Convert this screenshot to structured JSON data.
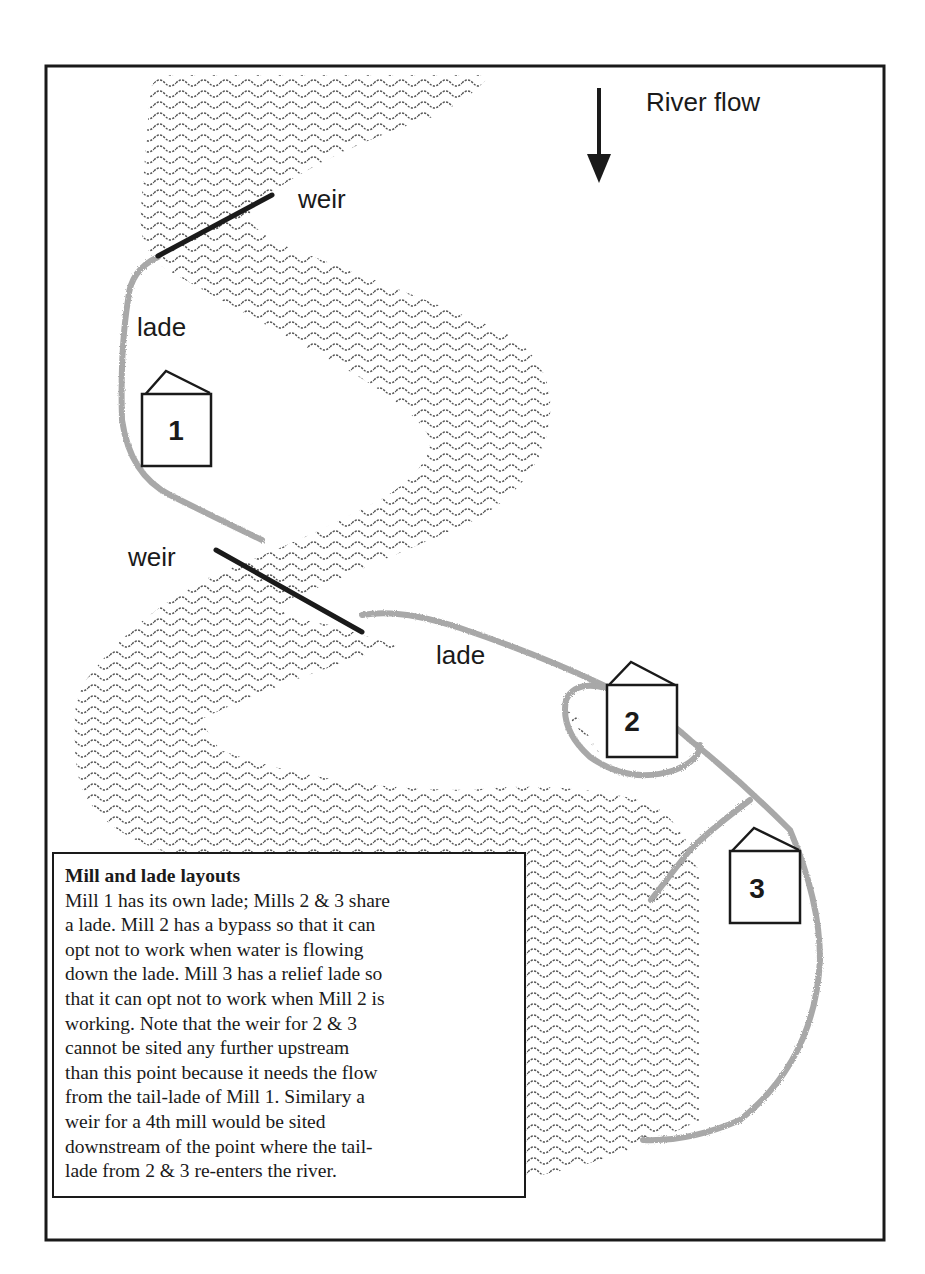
{
  "diagram": {
    "flow_label": "River flow",
    "flow_direction": "down",
    "weirs": [
      {
        "id": "weir-1",
        "label": "weir"
      },
      {
        "id": "weir-2",
        "label": "weir"
      }
    ],
    "lades": [
      {
        "id": "lade-1",
        "label": "lade"
      },
      {
        "id": "lade-2",
        "label": "lade"
      }
    ],
    "mills": [
      {
        "id": "mill-1",
        "number": "1"
      },
      {
        "id": "mill-2",
        "number": "2"
      },
      {
        "id": "mill-3",
        "number": "3"
      }
    ],
    "colors": {
      "ink": "#1a1a1a",
      "river_hatch": "#555555",
      "lade": "#a8a8a8",
      "paper": "#ffffff"
    }
  },
  "caption": {
    "title": "Mill and lade layouts",
    "lines": [
      "Mill 1 has its own lade; Mills 2 & 3 share",
      "a lade.  Mill 2 has a bypass so that it can",
      "opt not to work when water is flowing",
      "down the lade.  Mill 3 has a relief lade so",
      "that it can opt not to work when Mill 2 is",
      "working.  Note that the weir for 2 & 3",
      "cannot be sited any further upstream",
      "than this point because it needs the flow",
      "from the tail-lade of Mill 1.  Similary a",
      "weir for a 4th mill would be sited",
      "downstream of the point where the tail-",
      "lade from 2 & 3 re-enters the river."
    ]
  }
}
